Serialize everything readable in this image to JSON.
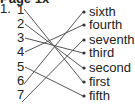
{
  "header": {
    "text": "Page 1x"
  },
  "question": {
    "number": "1."
  },
  "left_items": [
    {
      "label": "1",
      "y": 3
    },
    {
      "label": "2",
      "y": 17
    },
    {
      "label": "3",
      "y": 31
    },
    {
      "label": "4",
      "y": 45
    },
    {
      "label": "5",
      "y": 60
    },
    {
      "label": "6",
      "y": 74
    },
    {
      "label": "7",
      "y": 88
    }
  ],
  "right_items": [
    {
      "label": "sixth",
      "y": 5
    },
    {
      "label": "fourth",
      "y": 18
    },
    {
      "label": "seventh",
      "y": 33
    },
    {
      "label": "third",
      "y": 46
    },
    {
      "label": "second",
      "y": 61
    },
    {
      "label": "first",
      "y": 75
    },
    {
      "label": "fifth",
      "y": 89
    }
  ],
  "matches": [
    {
      "from": "1",
      "to": "first"
    },
    {
      "from": "2",
      "to": "second"
    },
    {
      "from": "3",
      "to": "third"
    },
    {
      "from": "4",
      "to": "fourth"
    },
    {
      "from": "5",
      "to": "fifth"
    },
    {
      "from": "6",
      "to": "sixth"
    },
    {
      "from": "7",
      "to": "seventh"
    }
  ],
  "colors": {
    "line": "#555555",
    "text": "#222222"
  }
}
